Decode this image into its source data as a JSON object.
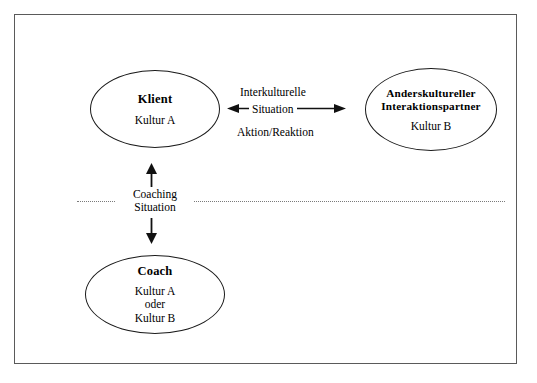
{
  "diagram": {
    "background_color": "#ffffff",
    "border_color": "#5a5a5a",
    "line_color": "#1a1a1a",
    "dotted_line_color": "#7a7a7a",
    "nodes": [
      {
        "id": "klient",
        "title": "Klient",
        "subtitle": "Kultur A",
        "shape": "ellipse"
      },
      {
        "id": "partner",
        "title_line1": "Anderskultureller",
        "title_line2": "Interaktionspartner",
        "subtitle": "Kultur B",
        "shape": "ellipse"
      },
      {
        "id": "coach",
        "title": "Coach",
        "subtitle_line1": "Kultur A",
        "subtitle_line2": "oder",
        "subtitle_line3": "Kultur B",
        "shape": "ellipse"
      }
    ],
    "connectors": {
      "horizontal": {
        "label_line1": "Interkulturelle",
        "label_line2": "Situation",
        "label_below": "Aktion/Reaktion",
        "arrow_type": "double-headed"
      },
      "vertical": {
        "label_line1": "Coaching",
        "label_line2": "Situation",
        "arrow_type": "double-headed"
      }
    },
    "separator": {
      "style": "dotted",
      "orientation": "horizontal"
    }
  }
}
